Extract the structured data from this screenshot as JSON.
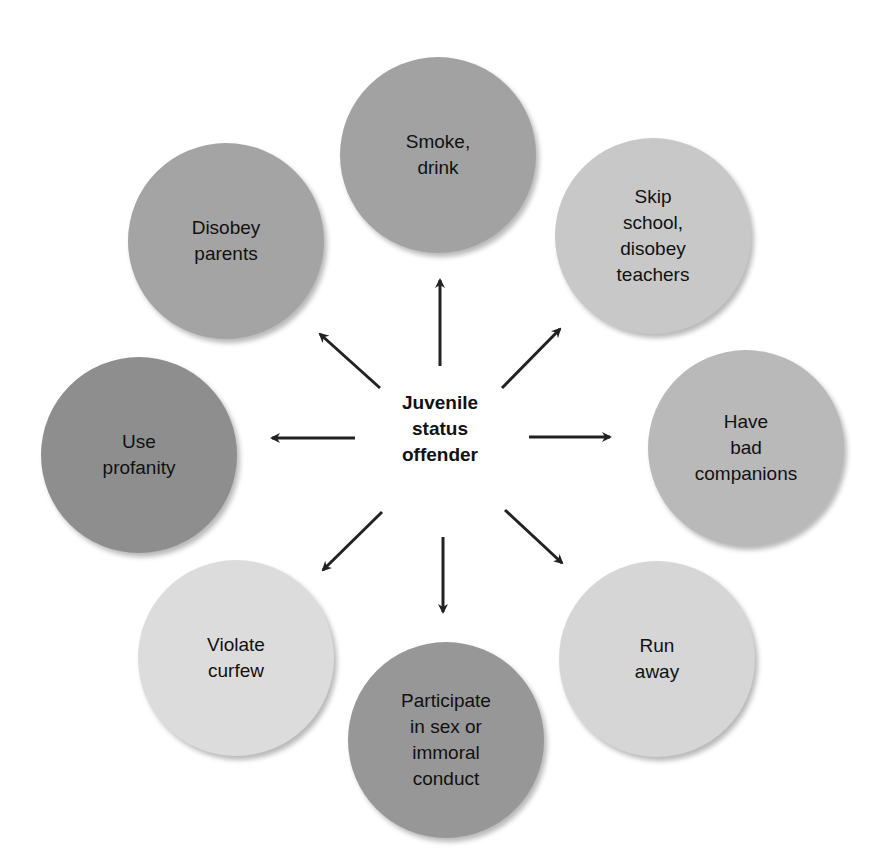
{
  "diagram": {
    "center": {
      "label": "Juvenile\nstatus\noffender"
    },
    "nodes": [
      {
        "id": "smoke-drink",
        "label": "Smoke,\ndrink",
        "fill": "#a2a2a2"
      },
      {
        "id": "skip-school",
        "label": "Skip\nschool,\ndisobey\nteachers",
        "fill": "#c8c8c8"
      },
      {
        "id": "bad-companions",
        "label": "Have\nbad\ncompanions",
        "fill": "#b9b9b9"
      },
      {
        "id": "run-away",
        "label": "Run\naway",
        "fill": "#d6d6d6"
      },
      {
        "id": "participate-sex",
        "label": "Participate\nin sex or\nimmoral\nconduct",
        "fill": "#979797"
      },
      {
        "id": "violate-curfew",
        "label": "Violate\ncurfew",
        "fill": "#dcdcdc"
      },
      {
        "id": "use-profanity",
        "label": "Use\nprofanity",
        "fill": "#8e8e8e"
      },
      {
        "id": "disobey-parents",
        "label": "Disobey\nparents",
        "fill": "#a4a4a4"
      }
    ],
    "arrow_color": "#222222"
  }
}
